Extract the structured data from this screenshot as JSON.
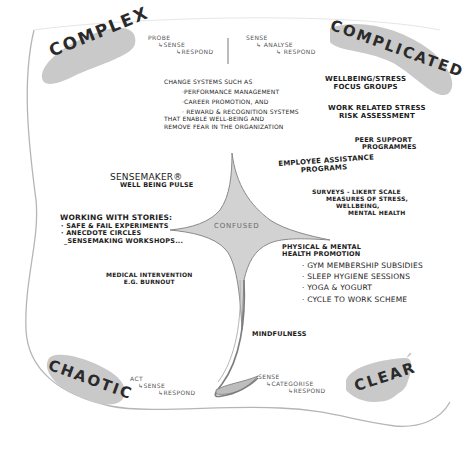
{
  "domains": {
    "complex": "COMPLEX",
    "complicated": "COMPLICATED",
    "chaotic": "CHAOTIC",
    "clear": "CLEAR",
    "confused": "CONFUSED"
  },
  "approaches": {
    "complex": [
      "PROBE",
      "↳SENSE",
      "↳RESPOND"
    ],
    "complicated": [
      "SENSE",
      "↳ ANALYSE",
      "↳ RESPOND"
    ],
    "chaotic": [
      "ACT",
      "↳SENSE",
      "↳RESPOND"
    ],
    "clear": [
      "SENSE",
      "↳CATEGORISE",
      "↳RESPOND"
    ]
  },
  "complex_items": {
    "change_systems": {
      "intro": "CHANGE SYSTEMS SUCH AS",
      "bullets": [
        "·PERFORMANCE MANAGEMENT",
        "·CAREER PROMOTION, AND",
        "· REWARD & RECOGNITION SYSTEMS"
      ],
      "outro": [
        "THAT ENABLE WELL-BEING AND",
        "REMOVE FEAR IN THE ORGANIZATION"
      ]
    },
    "sensemaker": [
      "SENSEMAKER®",
      "WELL BEING PULSE"
    ],
    "working_with_stories": {
      "title": "WORKING WITH STORIES:",
      "bullets": [
        "· SAFE & FAIL EXPERIMENTS",
        "· ANECDOTE CIRCLES",
        " _SENSEMAKING WORKSHOPS..."
      ]
    }
  },
  "complicated_items": {
    "focus_groups": [
      "WELLBEING/STRESS",
      "FOCUS GROUPS"
    ],
    "risk_assessment": [
      "WORK RELATED STRESS",
      "RISK ASSESSMENT"
    ],
    "peer_support": [
      "PEER SUPPORT",
      "PROGRAMMES"
    ],
    "employee_assistance": [
      "EMPLOYEE ASSISTANCE",
      "PROGRAMS"
    ],
    "surveys": [
      "SURVEYS - LIKERT SCALE",
      "MEASURES OF STRESS,",
      "WELLBEING,",
      "MENTAL HEALTH"
    ]
  },
  "chaotic_items": {
    "medical": [
      "MEDICAL INTERVENTION",
      "E.G. BURNOUT"
    ]
  },
  "clear_items": {
    "health_promotion": {
      "title": [
        "PHYSICAL & MENTAL",
        "HEALTH PROMOTION"
      ],
      "bullets": [
        "· GYM MEMBERSHIP SUBSIDIES",
        "· SLEEP HYGIENE SESSIONS",
        "· YOGA & YOGURT",
        "· CYCLE TO WORK SCHEME"
      ]
    },
    "mindfulness": "MINDFULNESS"
  },
  "colors": {
    "blob_fill": "#c9c9c9",
    "confused_fill": "#cfcfcf",
    "outline": "#9a9a9a",
    "ink": "#1c1c1c"
  }
}
